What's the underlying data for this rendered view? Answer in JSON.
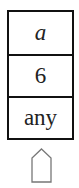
{
  "stack": {
    "cells": [
      {
        "label": "a",
        "style": "italic"
      },
      {
        "label": "6",
        "style": "normal"
      },
      {
        "label": "any",
        "style": "normal"
      }
    ]
  },
  "pointer": {
    "icon": "pentagon-up-arrow-icon",
    "stroke": "#777777"
  },
  "colors": {
    "border": "#111111",
    "text": "#222222",
    "background": "#ffffff"
  }
}
